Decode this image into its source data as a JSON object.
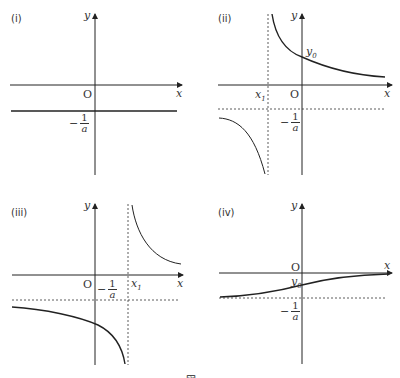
{
  "figure": {
    "panels": [
      {
        "id": "i",
        "label": "(i)",
        "x_axis_label": "x",
        "y_axis_label": "y",
        "origin_label": "O",
        "asymptote_label_minus": "−",
        "asymptote_label_num": "1",
        "asymptote_label_den": "a",
        "description": "Horizontal line y = -1/a"
      },
      {
        "id": "ii",
        "label": "(ii)",
        "x_axis_label": "x",
        "y_axis_label": "y",
        "origin_label": "O",
        "x1_label": "x",
        "x1_sub": "1",
        "y0_label": "y",
        "y0_sub": "0",
        "asymptote_label_minus": "−",
        "asymptote_label_num": "1",
        "asymptote_label_den": "a",
        "description": "Hyperbola with vertical asymptote x = x1 < 0 and horizontal asymptote y = -1/a; right branch crosses y-axis at y0 > 0"
      },
      {
        "id": "iii",
        "label": "(iii)",
        "x_axis_label": "x",
        "y_axis_label": "y",
        "origin_label": "O",
        "x1_label": "x",
        "x1_sub": "1",
        "asymptote_label_minus": "−",
        "asymptote_label_num": "1",
        "asymptote_label_den": "a",
        "description": "Hyperbola with vertical asymptote x = x1 > 0 and horizontal asymptote y = -1/a; left branch crosses y-axis below"
      },
      {
        "id": "iv",
        "label": "(iv)",
        "x_axis_label": "x",
        "y_axis_label": "y",
        "origin_label": "O",
        "y0_label": "y",
        "y0_sub": "0",
        "asymptote_label_minus": "−",
        "asymptote_label_num": "1",
        "asymptote_label_den": "a",
        "description": "Increasing curve from asymptote y = -1/a toward y = 0, passing through y0 between them"
      }
    ],
    "caption": "図"
  }
}
